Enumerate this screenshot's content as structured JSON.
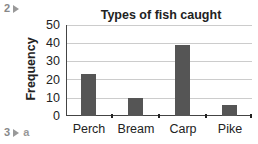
{
  "question_labels": {
    "q2": "2",
    "q3": "3",
    "q3_sub": "a"
  },
  "chart_data": {
    "type": "bar",
    "title": "Types of fish caught",
    "xlabel": "",
    "ylabel": "Frequency",
    "categories": [
      "Perch",
      "Bream",
      "Carp",
      "Pike"
    ],
    "values": [
      23,
      10,
      39,
      6
    ],
    "ylim": [
      0,
      50
    ],
    "yticks": [
      "0",
      "10",
      "20",
      "30",
      "40",
      "50"
    ],
    "grid": true,
    "legend": null,
    "bar_color": "#555555"
  }
}
